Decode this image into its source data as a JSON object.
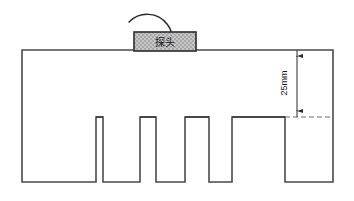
{
  "diagram": {
    "title": "",
    "type": "ultrasonic-test-block-cross-section",
    "probe": {
      "label": "探头",
      "fill_color": "#bfbfbf",
      "border_color": "#2b2b2b",
      "x": 134,
      "y": 32,
      "width": 62,
      "height": 19
    },
    "cable": {
      "name": "probe-cable",
      "color": "#2b2b2b"
    },
    "block": {
      "name": "test-block",
      "border_color": "#4a4a4a",
      "fill_color": "#ffffff",
      "x": 22,
      "y": 50,
      "width": 311,
      "height": 132
    },
    "dimension": {
      "label": "25mm",
      "value": 25,
      "unit": "mm",
      "color": "#2b2b2b",
      "line_x": 297,
      "top_y": 50,
      "bottom_y": 117,
      "reference_style": "dashed"
    },
    "slots": [
      {
        "name": "slot-1",
        "left": 96,
        "right": 103,
        "top": 117,
        "width_label": ""
      },
      {
        "name": "slot-2",
        "left": 140,
        "right": 156,
        "top": 117,
        "width_label": ""
      },
      {
        "name": "slot-3",
        "left": 185,
        "right": 209,
        "top": 117,
        "width_label": ""
      },
      {
        "name": "slot-4",
        "left": 232,
        "right": 285,
        "top": 117,
        "width_label": ""
      }
    ],
    "slot_count": 4,
    "slot_depth_label": "25mm",
    "colors": {
      "outline": "#4a4a4a",
      "slot_line": "#3a3a3a",
      "dimension": "#2b2b2b",
      "probe_fill": "#bfbfbf",
      "background": "#ffffff"
    }
  }
}
